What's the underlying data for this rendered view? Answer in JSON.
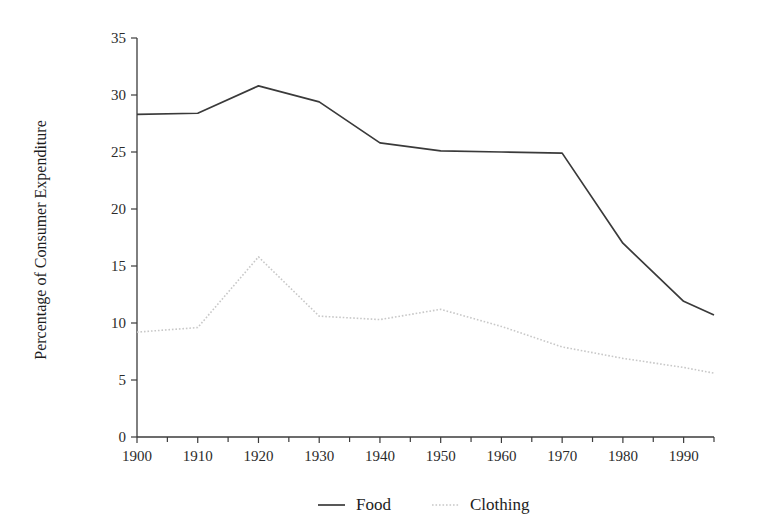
{
  "chart_data": {
    "type": "line",
    "title": "",
    "xlabel": "",
    "ylabel": "Percentage of Consumer Expenditure",
    "xlim": [
      1900,
      1995
    ],
    "ylim": [
      0,
      35
    ],
    "grid": false,
    "legend_position": "bottom",
    "x_ticks": [
      1900,
      1910,
      1920,
      1930,
      1940,
      1950,
      1960,
      1970,
      1980,
      1990
    ],
    "x_tick_labels": [
      "1900",
      "1910",
      "1920",
      "1930",
      "1940",
      "1950",
      "1960",
      "1970",
      "1980",
      "1990"
    ],
    "x_minor_ticks": [
      1905,
      1915,
      1925,
      1935,
      1945,
      1955,
      1965,
      1975,
      1985,
      1995
    ],
    "y_ticks": [
      0,
      5,
      10,
      15,
      20,
      25,
      30,
      35
    ],
    "y_tick_labels": [
      "0",
      "5",
      "10",
      "15",
      "20",
      "25",
      "30",
      "35"
    ],
    "x": [
      1900,
      1910,
      1920,
      1930,
      1940,
      1950,
      1960,
      1970,
      1980,
      1990,
      1995
    ],
    "series": [
      {
        "name": "Food",
        "color": "#3a3a3a",
        "style": "solid",
        "values": [
          28.3,
          28.4,
          30.8,
          29.4,
          25.8,
          25.1,
          25.0,
          24.9,
          17.0,
          11.9,
          10.7
        ]
      },
      {
        "name": "Clothing",
        "color": "#c8c8c8",
        "style": "dotted",
        "values": [
          9.2,
          9.6,
          15.8,
          10.6,
          10.3,
          11.2,
          9.7,
          7.9,
          6.9,
          6.1,
          5.6
        ]
      }
    ]
  },
  "legend": {
    "items": [
      {
        "label": "Food",
        "marker": "solid-line-swatch"
      },
      {
        "label": "Clothing",
        "marker": "dotted-line-swatch"
      }
    ]
  }
}
